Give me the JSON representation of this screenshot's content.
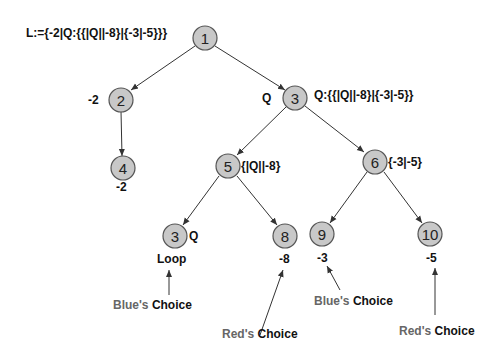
{
  "diagram": {
    "title_label": "L:={-2|Q:{{|Q||-8}|{-3|-5}}}",
    "nodes": [
      {
        "id": "1",
        "label": "1",
        "x": 205,
        "y": 38,
        "side": ""
      },
      {
        "id": "2",
        "label": "2",
        "x": 121,
        "y": 100,
        "side": "-2",
        "below": ""
      },
      {
        "id": "3",
        "label": "3",
        "x": 295,
        "y": 98,
        "side_left": "Q",
        "side": "Q:{{|Q||-8}|{-3|-5}}"
      },
      {
        "id": "4",
        "label": "4",
        "x": 123,
        "y": 168,
        "below": "-2"
      },
      {
        "id": "5",
        "label": "5",
        "x": 228,
        "y": 166,
        "side": "{|Q||-8}"
      },
      {
        "id": "6",
        "label": "6",
        "x": 375,
        "y": 162,
        "side": "{-3|-5}"
      },
      {
        "id": "3b",
        "label": "3",
        "x": 175,
        "y": 236,
        "side": "Q",
        "below": "Loop"
      },
      {
        "id": "8",
        "label": "8",
        "x": 285,
        "y": 236,
        "below": "-8"
      },
      {
        "id": "9",
        "label": "9",
        "x": 322,
        "y": 234,
        "below": "-3"
      },
      {
        "id": "10",
        "label": "10",
        "x": 430,
        "y": 234,
        "below": "-5"
      }
    ],
    "edges": [
      {
        "from": "1",
        "to": "2"
      },
      {
        "from": "1",
        "to": "3"
      },
      {
        "from": "2",
        "to": "4"
      },
      {
        "from": "3",
        "to": "5"
      },
      {
        "from": "3",
        "to": "6"
      },
      {
        "from": "5",
        "to": "3b"
      },
      {
        "from": "5",
        "to": "8"
      },
      {
        "from": "6",
        "to": "9"
      },
      {
        "from": "6",
        "to": "10"
      }
    ],
    "annotations": [
      {
        "player": "Blue's",
        "word": "Choice",
        "target": "Loop"
      },
      {
        "player": "Red's",
        "word": "Choice",
        "target": "-8"
      },
      {
        "player": "Blue's",
        "word": "Choice",
        "target": "-3"
      },
      {
        "player": "Red's",
        "word": "Choice",
        "target": "-5"
      }
    ]
  }
}
